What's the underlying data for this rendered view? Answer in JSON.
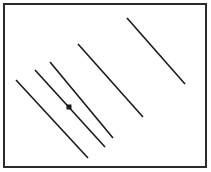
{
  "figure": {
    "width": 211,
    "height": 172,
    "background_color": "#ffffff",
    "stroke_color": "#1a1a1a",
    "border": {
      "color": "#2b2b2b",
      "stroke_width": 2,
      "x": 4,
      "y": 4,
      "width": 202,
      "height": 163
    }
  },
  "chart_data": {
    "type": "scatter",
    "xlabel": "",
    "ylabel": "",
    "xlim": [
      0,
      211
    ],
    "ylim": [
      0,
      172
    ],
    "grid": false,
    "legend": "none",
    "segments": [
      {
        "name": "segment-1",
        "x1": 16,
        "y1": 80,
        "x2": 88,
        "y2": 158,
        "stroke_width": 1.6
      },
      {
        "name": "segment-2",
        "x1": 35,
        "y1": 70,
        "x2": 105,
        "y2": 147,
        "stroke_width": 1.6
      },
      {
        "name": "segment-3",
        "x1": 50,
        "y1": 62,
        "x2": 113,
        "y2": 138,
        "stroke_width": 1.6
      },
      {
        "name": "segment-4",
        "x1": 78,
        "y1": 44,
        "x2": 143,
        "y2": 117,
        "stroke_width": 1.6
      },
      {
        "name": "segment-5",
        "x1": 127,
        "y1": 18,
        "x2": 185,
        "y2": 84,
        "stroke_width": 1.6
      }
    ],
    "markers": [
      {
        "name": "point-marker",
        "shape": "square",
        "x": 69,
        "y": 107,
        "size": 5,
        "fill": "#1a1a1a"
      }
    ]
  }
}
